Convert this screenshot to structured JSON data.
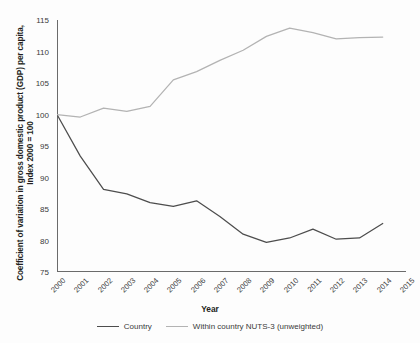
{
  "chart_data": {
    "type": "line",
    "title": "",
    "xlabel": "Year",
    "ylabel": "Coefficient of variation in gross domestic product (GDP) per capita, Index 2000 = 100",
    "x": [
      2000,
      2001,
      2002,
      2003,
      2004,
      2005,
      2006,
      2007,
      2008,
      2009,
      2010,
      2011,
      2012,
      2013,
      2014,
      2015
    ],
    "categories": [
      "2000",
      "2001",
      "2002",
      "2003",
      "2004",
      "2005",
      "2006",
      "2007",
      "2008",
      "2009",
      "2010",
      "2011",
      "2012",
      "2013",
      "2014",
      "2015"
    ],
    "xlim": [
      2000,
      2015
    ],
    "ylim": [
      75,
      115
    ],
    "yticks": [
      75,
      80,
      85,
      90,
      95,
      100,
      105,
      110,
      115
    ],
    "grid": false,
    "legend_position": "bottom",
    "series": [
      {
        "name": "Country",
        "color": "#4d4d4d",
        "x": [
          2000,
          2001,
          2002,
          2003,
          2004,
          2005,
          2006,
          2007,
          2008,
          2009,
          2010,
          2011,
          2012,
          2013,
          2014
        ],
        "values": [
          100.0,
          93.4,
          88.1,
          87.4,
          86.0,
          85.4,
          86.3,
          83.8,
          81.0,
          79.7,
          80.4,
          81.8,
          80.2,
          80.4,
          82.7
        ]
      },
      {
        "name": "Within country NUTS-3 (unweighted)",
        "color": "#b3b3b3",
        "x": [
          2000,
          2001,
          2002,
          2003,
          2004,
          2005,
          2006,
          2007,
          2008,
          2009,
          2010,
          2011,
          2012,
          2013,
          2014
        ],
        "values": [
          100.0,
          99.6,
          101.0,
          100.5,
          101.3,
          105.5,
          106.8,
          108.6,
          110.2,
          112.4,
          113.7,
          113.0,
          112.0,
          112.2,
          112.3
        ]
      }
    ]
  },
  "axis": {
    "y_label": "Coefficient of variation in gross domestic product (GDP) per capita, Index 2000 = 100",
    "x_label": "Year"
  },
  "legend": {
    "items": [
      {
        "label": "Country",
        "color": "#4d4d4d"
      },
      {
        "label": "Within country NUTS-3 (unweighted)",
        "color": "#b3b3b3"
      }
    ]
  }
}
